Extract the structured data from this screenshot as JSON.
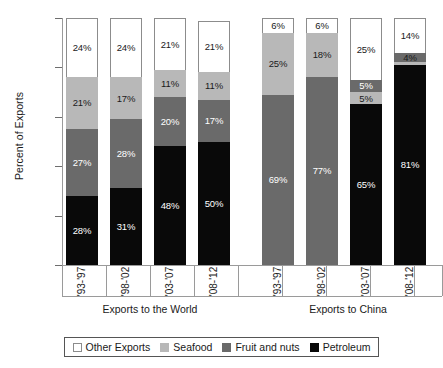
{
  "chart_data": {
    "type": "bar",
    "stacked": true,
    "title": "",
    "xlabel": "",
    "ylabel": "Percent of Exports",
    "ylim": [
      0,
      100
    ],
    "ytick_labels": [
      "0%",
      "20%",
      "40%",
      "60%",
      "80%",
      "100%"
    ],
    "ytick_values": [
      0,
      20,
      40,
      60,
      80,
      100
    ],
    "grid": false,
    "legend_position": "bottom",
    "legend_entries": [
      "Other Exports",
      "Seafood",
      "Fruit and nuts",
      "Petroleum"
    ],
    "series_colors": {
      "Other Exports": "#ffffff",
      "Seafood": "#b8b8b8",
      "Fruit and nuts": "#6a6a6a",
      "Petroleum": "#090909"
    },
    "groups": [
      {
        "name": "Exports to the World",
        "categories": [
          "'93-'97",
          "'98-'02",
          "'03-'07",
          "'08-'12"
        ]
      },
      {
        "name": "Exports to China",
        "categories": [
          "'93-'97",
          "'98-'02",
          "'03-'07",
          "'08-'12"
        ]
      }
    ],
    "series": [
      {
        "name": "Petroleum",
        "values": [
          28,
          31,
          48,
          50,
          0,
          0,
          65,
          81
        ]
      },
      {
        "name": "Fruit and nuts",
        "values": [
          27,
          28,
          20,
          17,
          69,
          77,
          5,
          4
        ]
      },
      {
        "name": "Seafood",
        "values": [
          21,
          17,
          11,
          11,
          25,
          18,
          5,
          1
        ]
      },
      {
        "name": "Other Exports",
        "values": [
          24,
          24,
          21,
          21,
          6,
          6,
          25,
          14
        ]
      }
    ]
  },
  "axes": {
    "y_title": "Percent of Exports",
    "y_ticks": [
      {
        "label": "100%",
        "value": 100
      },
      {
        "label": "80%",
        "value": 80
      },
      {
        "label": "60%",
        "value": 60
      },
      {
        "label": "40%",
        "value": 40
      },
      {
        "label": "20%",
        "value": 20
      },
      {
        "label": "0%",
        "value": 0
      }
    ]
  },
  "bars": [
    {
      "group": "world",
      "category": "'93-'97",
      "segments": [
        {
          "series": "Petroleum",
          "value": 28,
          "label": "28%",
          "swatch": "petro",
          "text": "light"
        },
        {
          "series": "Fruit and nuts",
          "value": 27,
          "label": "27%",
          "swatch": "fruit",
          "text": "light"
        },
        {
          "series": "Seafood",
          "value": 21,
          "label": "21%",
          "swatch": "seafood",
          "text": "dark"
        },
        {
          "series": "Other Exports",
          "value": 24,
          "label": "24%",
          "swatch": "other",
          "text": "dark"
        }
      ]
    },
    {
      "group": "world",
      "category": "'98-'02",
      "segments": [
        {
          "series": "Petroleum",
          "value": 31,
          "label": "31%",
          "swatch": "petro",
          "text": "light"
        },
        {
          "series": "Fruit and nuts",
          "value": 28,
          "label": "28%",
          "swatch": "fruit",
          "text": "light"
        },
        {
          "series": "Seafood",
          "value": 17,
          "label": "17%",
          "swatch": "seafood",
          "text": "dark"
        },
        {
          "series": "Other Exports",
          "value": 24,
          "label": "24%",
          "swatch": "other",
          "text": "dark"
        }
      ]
    },
    {
      "group": "world",
      "category": "'03-'07",
      "segments": [
        {
          "series": "Petroleum",
          "value": 48,
          "label": "48%",
          "swatch": "petro",
          "text": "light"
        },
        {
          "series": "Fruit and nuts",
          "value": 20,
          "label": "20%",
          "swatch": "fruit",
          "text": "light"
        },
        {
          "series": "Seafood",
          "value": 11,
          "label": "11%",
          "swatch": "seafood",
          "text": "dark"
        },
        {
          "series": "Other Exports",
          "value": 21,
          "label": "21%",
          "swatch": "other",
          "text": "dark"
        }
      ]
    },
    {
      "group": "world",
      "category": "'08-'12",
      "segments": [
        {
          "series": "Petroleum",
          "value": 50,
          "label": "50%",
          "swatch": "petro",
          "text": "light"
        },
        {
          "series": "Fruit and nuts",
          "value": 17,
          "label": "17%",
          "swatch": "fruit",
          "text": "light"
        },
        {
          "series": "Seafood",
          "value": 11,
          "label": "11%",
          "swatch": "seafood",
          "text": "dark"
        },
        {
          "series": "Other Exports",
          "value": 21,
          "label": "21%",
          "swatch": "other",
          "text": "dark"
        }
      ]
    },
    {
      "group": "china",
      "category": "'93-'97",
      "segments": [
        {
          "series": "Fruit and nuts",
          "value": 69,
          "label": "69%",
          "swatch": "fruit",
          "text": "light"
        },
        {
          "series": "Seafood",
          "value": 25,
          "label": "25%",
          "swatch": "seafood",
          "text": "dark"
        },
        {
          "series": "Other Exports",
          "value": 6,
          "label": "6%",
          "swatch": "other",
          "text": "dark"
        }
      ]
    },
    {
      "group": "china",
      "category": "'98-'02",
      "segments": [
        {
          "series": "Fruit and nuts",
          "value": 77,
          "label": "77%",
          "swatch": "fruit",
          "text": "light"
        },
        {
          "series": "Seafood",
          "value": 18,
          "label": "18%",
          "swatch": "seafood",
          "text": "dark"
        },
        {
          "series": "Other Exports",
          "value": 6,
          "label": "6%",
          "swatch": "other",
          "text": "dark"
        }
      ]
    },
    {
      "group": "china",
      "category": "'03-'07",
      "segments": [
        {
          "series": "Petroleum",
          "value": 65,
          "label": "65%",
          "swatch": "petro",
          "text": "light"
        },
        {
          "series": "Seafood",
          "value": 5,
          "label": "5%",
          "swatch": "seafood",
          "text": "dark"
        },
        {
          "series": "Fruit and nuts",
          "value": 5,
          "label": "5%",
          "swatch": "fruit",
          "text": "light"
        },
        {
          "series": "Other Exports",
          "value": 25,
          "label": "25%",
          "swatch": "other",
          "text": "dark"
        }
      ]
    },
    {
      "group": "china",
      "category": "'08-'12",
      "segments": [
        {
          "series": "Petroleum",
          "value": 81,
          "label": "81%",
          "swatch": "petro",
          "text": "light"
        },
        {
          "series": "Seafood",
          "value": 1,
          "label": "",
          "swatch": "seafood",
          "text": "dark"
        },
        {
          "series": "Fruit and nuts",
          "value": 4,
          "label": "4%",
          "swatch": "fruit",
          "text": "dark"
        },
        {
          "series": "Other Exports",
          "value": 14,
          "label": "14%",
          "swatch": "other",
          "text": "dark"
        }
      ]
    }
  ],
  "group_labels": [
    {
      "key": "world",
      "label": "Exports to the World"
    },
    {
      "key": "china",
      "label": "Exports to China"
    }
  ],
  "legend": {
    "items": [
      {
        "label": "Other Exports",
        "swatch": "other"
      },
      {
        "label": "Seafood",
        "swatch": "seafood"
      },
      {
        "label": "Fruit and nuts",
        "swatch": "fruit"
      },
      {
        "label": "Petroleum",
        "swatch": "petro"
      }
    ]
  }
}
